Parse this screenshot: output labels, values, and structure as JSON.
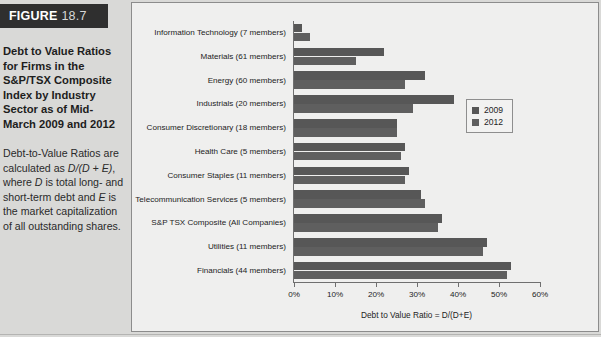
{
  "figure": {
    "tag_word": "FIGURE",
    "tag_number": "18.7",
    "title": "Debt to Value Ratios for Firms in the S&P/TSX Composite Index by Industry Sector as of Mid-March 2009 and 2012",
    "description_prefix": "Debt-to-Value Ratios are calculated as ",
    "description_formula_1": "D/(D + E)",
    "description_mid_1": ", where ",
    "description_var_d": "D",
    "description_mid_2": " is total long- and short-term debt and ",
    "description_var_e": "E",
    "description_suffix": " is the market capitalization of all outstanding shares."
  },
  "legend": {
    "position": "right-inside",
    "entries": [
      {
        "label": "2009",
        "color": "#575757",
        "icon": "square-swatch"
      },
      {
        "label": "2012",
        "color": "#5f5f5f",
        "icon": "square-swatch"
      }
    ]
  },
  "chart_data": {
    "type": "bar",
    "orientation": "horizontal",
    "title": "",
    "xlabel": "Debt to Value Ratio = D/(D+E)",
    "ylabel": "",
    "xlim": [
      0,
      60
    ],
    "xtick_labels": [
      "0%",
      "10%",
      "20%",
      "30%",
      "40%",
      "50%",
      "60%"
    ],
    "xticks": [
      0,
      10,
      20,
      30,
      40,
      50,
      60
    ],
    "grid": false,
    "units": "percent",
    "categories": [
      "Information Technology (7 members)",
      "Materials (61 members)",
      "Energy (60 members)",
      "Industrials (20 members)",
      "Consumer Discretionary (18 members)",
      "Health Care (5 members)",
      "Consumer Staples (11 members)",
      "Telecommunication Services (5 members)",
      "S&P TSX Composite (All Companies)",
      "Utilities (11 members)",
      "Financials (44 members)"
    ],
    "series": [
      {
        "name": "2009",
        "color": "#575757",
        "values": [
          2,
          22,
          32,
          39,
          25,
          27,
          28,
          31,
          36,
          47,
          53
        ]
      },
      {
        "name": "2012",
        "color": "#5f5f5f",
        "values": [
          4,
          15,
          27,
          29,
          25,
          26,
          27,
          32,
          35,
          46,
          52
        ]
      }
    ]
  }
}
